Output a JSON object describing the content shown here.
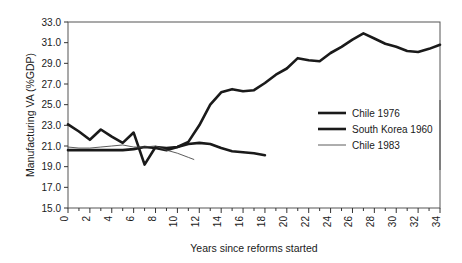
{
  "chart_data": {
    "type": "line",
    "title": "",
    "xlabel": "Years since reforms started",
    "ylabel": "Manufacturing VA (%GDP)",
    "xlim": [
      0,
      34
    ],
    "ylim": [
      15.0,
      33.0
    ],
    "ytick_step": 2.0,
    "xtick_major_step": 2,
    "xtick_minor_step": 1,
    "grid": false,
    "legend_position": "right-middle",
    "yticks": [
      "15.0",
      "17.0",
      "19.0",
      "21.0",
      "23.0",
      "25.0",
      "27.0",
      "29.0",
      "31.0",
      "33.0"
    ],
    "xticks": [
      "0",
      "2",
      "4",
      "6",
      "8",
      "10",
      "12",
      "14",
      "16",
      "18",
      "20",
      "22",
      "24",
      "26",
      "28",
      "30",
      "32",
      "34"
    ],
    "series": [
      {
        "name": "Chile 1976",
        "style": "thick",
        "color": "#1a1a1a",
        "width": 2.6,
        "x": [
          0,
          1,
          2,
          3,
          4,
          5,
          6,
          7,
          8,
          9,
          10,
          11,
          12,
          13,
          14,
          15,
          16,
          17,
          18
        ],
        "values": [
          23.1,
          22.4,
          21.6,
          22.6,
          21.9,
          21.3,
          22.3,
          19.2,
          20.9,
          20.8,
          20.9,
          21.2,
          21.3,
          21.2,
          20.8,
          20.5,
          20.4,
          20.3,
          20.1
        ]
      },
      {
        "name": "South Korea 1960",
        "style": "thick",
        "color": "#1a1a1a",
        "width": 2.6,
        "x": [
          0,
          1,
          2,
          3,
          4,
          5,
          6,
          7,
          8,
          9,
          10,
          11,
          12,
          13,
          14,
          15,
          16,
          17,
          18,
          19,
          20,
          21,
          22,
          23,
          24,
          25,
          26,
          27,
          28,
          29,
          30,
          31,
          32,
          33,
          34
        ],
        "values": [
          20.6,
          20.6,
          20.6,
          20.6,
          20.6,
          20.6,
          20.7,
          20.9,
          20.8,
          20.6,
          20.9,
          21.4,
          23.0,
          25.0,
          26.2,
          26.5,
          26.3,
          26.4,
          27.1,
          27.9,
          28.5,
          29.5,
          29.3,
          29.2,
          30.0,
          30.6,
          31.3,
          31.9,
          31.4,
          30.9,
          30.6,
          30.2,
          30.1,
          30.4,
          30.8
        ]
      },
      {
        "name": "Chile 1983",
        "style": "thin",
        "color": "#4a4a4a",
        "width": 0.9,
        "x": [
          0,
          1,
          2,
          3,
          4,
          5,
          6,
          7,
          8,
          9,
          10,
          11,
          11.5
        ],
        "values": [
          20.9,
          20.8,
          20.8,
          20.9,
          21.0,
          21.1,
          20.9,
          20.9,
          21.0,
          20.6,
          20.3,
          19.9,
          19.7
        ]
      }
    ]
  },
  "legend": {
    "items": [
      {
        "label": "Chile 1976"
      },
      {
        "label": "South Korea 1960"
      },
      {
        "label": "Chile 1983"
      }
    ]
  }
}
